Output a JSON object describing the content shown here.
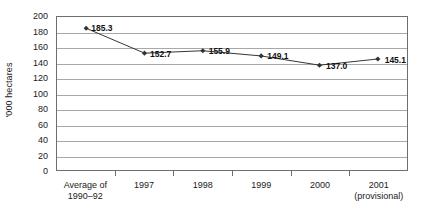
{
  "chart_data": {
    "type": "line",
    "title": "",
    "subtitle": "",
    "xlabel": "",
    "ylabel": "'000 hectares",
    "categories": [
      "Average of\n1990–92",
      "1997",
      "1998",
      "1999",
      "2000",
      "2001\n(provisional)"
    ],
    "category_lines": [
      [
        "Average of",
        "1990–92"
      ],
      [
        "1997",
        ""
      ],
      [
        "1998",
        ""
      ],
      [
        "1999",
        ""
      ],
      [
        "2000",
        ""
      ],
      [
        "2001",
        "(provisional)"
      ]
    ],
    "values": [
      185.3,
      152.7,
      155.9,
      149.1,
      137.0,
      145.1
    ],
    "data_labels": [
      "185.3",
      "152.7",
      "155.9",
      "149.1",
      "137.0",
      "145.1"
    ],
    "ylim": [
      0,
      200
    ],
    "ytick_step": 20,
    "yticks": [
      200,
      180,
      160,
      140,
      120,
      100,
      80,
      60,
      40,
      20,
      0
    ],
    "ytick_labels": [
      "200",
      "180",
      "160",
      "140",
      "120",
      "100",
      "80",
      "60",
      "40",
      "20",
      "0"
    ],
    "grid": true,
    "grid_axis": "y",
    "legend": false,
    "legend_position": "none",
    "marker": "diamond",
    "series_color": "#333333",
    "grid_color": "#a8a8a8",
    "axis_color": "#6e6e6e",
    "background_color": "#ffffff"
  }
}
